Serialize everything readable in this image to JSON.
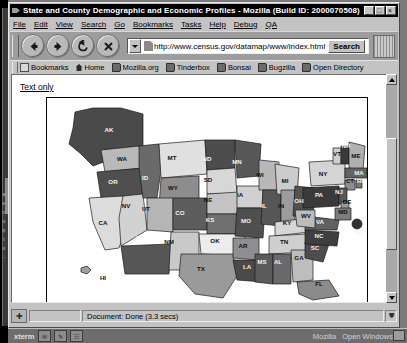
{
  "window": {
    "title": "State and County Demographic and Economic Profiles - Mozilla (Build ID: 2000070508)",
    "minimize_label": "_",
    "maximize_label": "□",
    "close_label": "×"
  },
  "menu": {
    "items": [
      {
        "label": "File"
      },
      {
        "label": "Edit"
      },
      {
        "label": "View"
      },
      {
        "label": "Search"
      },
      {
        "label": "Go"
      },
      {
        "label": "Bookmarks"
      },
      {
        "label": "Tasks"
      },
      {
        "label": "Help"
      },
      {
        "label": "Debug"
      },
      {
        "label": "QA"
      }
    ]
  },
  "toolbar": {
    "back_label": "Back",
    "forward_label": "Forward",
    "reload_label": "Reload",
    "stop_label": "Stop",
    "url_value": "http://www.census.gov/datamap/www/index.html",
    "url_placeholder": "Enter address",
    "search_label": "Search",
    "throbber_name": "mozilla-throbber"
  },
  "personal_bar": {
    "items": [
      {
        "label": "Bookmarks",
        "icon": "folder-icon"
      },
      {
        "label": "Home",
        "icon": "home-icon"
      },
      {
        "label": "Mozilla.org",
        "icon": "bookmark-icon"
      },
      {
        "label": "Tinderbox",
        "icon": "bookmark-icon"
      },
      {
        "label": "Bonsai",
        "icon": "bookmark-icon"
      },
      {
        "label": "Bugzilla",
        "icon": "bookmark-icon"
      },
      {
        "label": "Open Directory",
        "icon": "bookmark-icon"
      }
    ]
  },
  "page": {
    "text_only_link": "Text only",
    "map_alt": "United States demographic and economic profile clickable map"
  },
  "map": {
    "states": [
      {
        "abbr": "AK",
        "x": 62,
        "y": 34,
        "fill": "#4a4a4a"
      },
      {
        "abbr": "HI",
        "x": 56,
        "y": 182,
        "fill": "#9e9e9e"
      },
      {
        "abbr": "WA",
        "x": 75,
        "y": 63,
        "fill": "#b9b9b9"
      },
      {
        "abbr": "OR",
        "x": 66,
        "y": 86,
        "fill": "#4f4f4f"
      },
      {
        "abbr": "CA",
        "x": 56,
        "y": 127,
        "fill": "#dcdcdc"
      },
      {
        "abbr": "NV",
        "x": 79,
        "y": 110,
        "fill": "#d2d2d2"
      },
      {
        "abbr": "ID",
        "x": 98,
        "y": 82,
        "fill": "#6a6a6a"
      },
      {
        "abbr": "MT",
        "x": 125,
        "y": 62,
        "fill": "#e0e0e0"
      },
      {
        "abbr": "WY",
        "x": 126,
        "y": 92,
        "fill": "#8d8d8d"
      },
      {
        "abbr": "UT",
        "x": 99,
        "y": 113,
        "fill": "#b5b5b5"
      },
      {
        "abbr": "AZ",
        "x": 92,
        "y": 142,
        "fill": "#565656"
      },
      {
        "abbr": "NM",
        "x": 122,
        "y": 146,
        "fill": "#c9c9c9"
      },
      {
        "abbr": "CO",
        "x": 133,
        "y": 117,
        "fill": "#5d5d5d"
      },
      {
        "abbr": "ND",
        "x": 160,
        "y": 63,
        "fill": "#4c4c4c"
      },
      {
        "abbr": "SD",
        "x": 161,
        "y": 84,
        "fill": "#d7d7d7"
      },
      {
        "abbr": "NE",
        "x": 161,
        "y": 104,
        "fill": "#c4c4c4"
      },
      {
        "abbr": "KS",
        "x": 163,
        "y": 124,
        "fill": "#6f6f6f"
      },
      {
        "abbr": "OK",
        "x": 168,
        "y": 145,
        "fill": "#ededed"
      },
      {
        "abbr": "TX",
        "x": 154,
        "y": 173,
        "fill": "#9a9a9a"
      },
      {
        "abbr": "MN",
        "x": 190,
        "y": 66,
        "fill": "#585858"
      },
      {
        "abbr": "IA",
        "x": 193,
        "y": 99,
        "fill": "#d0d0d0"
      },
      {
        "abbr": "MO",
        "x": 199,
        "y": 125,
        "fill": "#4f4f4f"
      },
      {
        "abbr": "AR",
        "x": 196,
        "y": 150,
        "fill": "#8f8f8f"
      },
      {
        "abbr": "LA",
        "x": 200,
        "y": 171,
        "fill": "#4a4a4a"
      },
      {
        "abbr": "WI",
        "x": 213,
        "y": 79,
        "fill": "#b8b8b8"
      },
      {
        "abbr": "IL",
        "x": 217,
        "y": 110,
        "fill": "#565656"
      },
      {
        "abbr": "MI",
        "x": 238,
        "y": 85,
        "fill": "#cccccc"
      },
      {
        "abbr": "IN",
        "x": 234,
        "y": 110,
        "fill": "#9c9c9c"
      },
      {
        "abbr": "OH",
        "x": 252,
        "y": 105,
        "fill": "#525252"
      },
      {
        "abbr": "KY",
        "x": 240,
        "y": 127,
        "fill": "#d6d6d6"
      },
      {
        "abbr": "TN",
        "x": 237,
        "y": 146,
        "fill": "#cfcfcf"
      },
      {
        "abbr": "MS",
        "x": 215,
        "y": 166,
        "fill": "#5b5b5b"
      },
      {
        "abbr": "AL",
        "x": 231,
        "y": 166,
        "fill": "#6a6a6a"
      },
      {
        "abbr": "GA",
        "x": 252,
        "y": 162,
        "fill": "#bdbdbd"
      },
      {
        "abbr": "FL",
        "x": 272,
        "y": 188,
        "fill": "#8b8b8b"
      },
      {
        "abbr": "SC",
        "x": 268,
        "y": 152,
        "fill": "#4d4d4d"
      },
      {
        "abbr": "NC",
        "x": 272,
        "y": 140,
        "fill": "#3f3f3f"
      },
      {
        "abbr": "VA",
        "x": 273,
        "y": 126,
        "fill": "#616161"
      },
      {
        "abbr": "WV",
        "x": 259,
        "y": 120,
        "fill": "#bcbcbc"
      },
      {
        "abbr": "PA",
        "x": 272,
        "y": 99,
        "fill": "#3a3a3a"
      },
      {
        "abbr": "NY",
        "x": 276,
        "y": 78,
        "fill": "#d4d4d4"
      },
      {
        "abbr": "VT",
        "x": 290,
        "y": 58,
        "fill": "#cfcfcf"
      },
      {
        "abbr": "NH",
        "x": 299,
        "y": 50,
        "fill": "#3a3a3a"
      },
      {
        "abbr": "ME",
        "x": 309,
        "y": 60,
        "fill": "#b0b0b0"
      },
      {
        "abbr": "MA",
        "x": 312,
        "y": 77,
        "fill": "#636363"
      },
      {
        "abbr": "CT",
        "x": 303,
        "y": 85,
        "fill": "#8f8f8f"
      },
      {
        "abbr": "RI",
        "x": 313,
        "y": 85,
        "fill": "#777777"
      },
      {
        "abbr": "NJ",
        "x": 292,
        "y": 96,
        "fill": "#585858"
      },
      {
        "abbr": "DE",
        "x": 300,
        "y": 106,
        "fill": "#9a9a9a"
      },
      {
        "abbr": "MD",
        "x": 296,
        "y": 116,
        "fill": "#7d7d7d"
      },
      {
        "abbr": "DC",
        "x": 312,
        "y": 136,
        "fill": "#333333"
      }
    ]
  },
  "statusbar": {
    "status_text": "Document: Done (3.3 secs)",
    "security_icon": "lock-icon"
  },
  "taskbar": {
    "start_label": "xterm",
    "tasks": [
      "Mozilla",
      "Open Windows"
    ],
    "icons": [
      "mail-icon",
      "pencil-icon",
      "window-icon"
    ]
  }
}
